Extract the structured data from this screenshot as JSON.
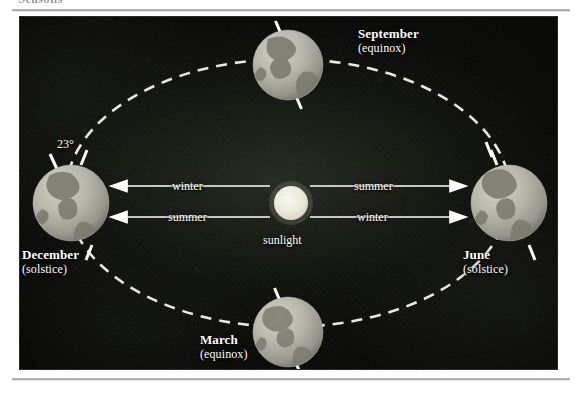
{
  "page": {
    "heading": "Seasons"
  },
  "figure": {
    "background_color": "#0b0b0a",
    "orbit": {
      "style": "dashed",
      "color": "#f2f2ea",
      "center": [
        268,
        176
      ],
      "radius_x": 222,
      "radius_y": 134
    },
    "sun": {
      "label": "sunlight",
      "color": "#eceadc",
      "center": [
        271,
        186
      ],
      "radius": 17
    },
    "positions": [
      {
        "id": "september",
        "month": "September",
        "event": "(equinox)",
        "label_x": 338,
        "label_y": 14,
        "globe_cx": 268,
        "globe_cy": 48,
        "globe_r": 35,
        "axis_tilt_deg": 23
      },
      {
        "id": "december",
        "month": "December",
        "event": "(solstice)",
        "label_x": 2,
        "label_y": 233,
        "globe_cx": 51,
        "globe_cy": 186,
        "globe_r": 38,
        "axis_tilt_deg": 23
      },
      {
        "id": "june",
        "month": "June",
        "event": "(solstice)",
        "label_x": 441,
        "label_y": 233,
        "globe_cx": 489,
        "globe_cy": 186,
        "globe_r": 38,
        "axis_tilt_deg": 23
      },
      {
        "id": "march",
        "month": "March",
        "event": "(equinox)",
        "label_x": 182,
        "label_y": 318,
        "globe_cx": 268,
        "globe_cy": 315,
        "globe_r": 35,
        "axis_tilt_deg": 23
      }
    ],
    "tilt_annotation": {
      "value": "23°",
      "x": 29,
      "y": 128
    },
    "season_arrows": [
      {
        "id": "winter-left",
        "label": "winter",
        "side": "left",
        "row": "top",
        "direction": "left",
        "y": 169
      },
      {
        "id": "summer-right",
        "label": "summer",
        "side": "right",
        "row": "top",
        "direction": "right",
        "y": 169
      },
      {
        "id": "summer-left",
        "label": "summer",
        "side": "left",
        "row": "bottom",
        "direction": "left",
        "y": 200
      },
      {
        "id": "winter-right",
        "label": "winter",
        "side": "right",
        "row": "bottom",
        "direction": "right",
        "y": 200
      }
    ]
  }
}
